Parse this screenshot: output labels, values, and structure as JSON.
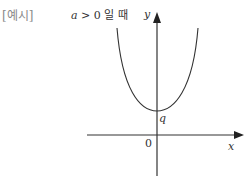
{
  "example_label": "[예시]",
  "condition": {
    "variable": "a",
    "relation": "> 0",
    "suffix": "일 때"
  },
  "axes": {
    "x_label": "x",
    "y_label": "y",
    "origin_label": "0"
  },
  "curve": {
    "type": "parabola",
    "opens": "up",
    "y_intercept_label": "q"
  }
}
